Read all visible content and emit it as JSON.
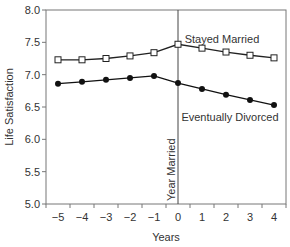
{
  "chart_data": {
    "type": "line",
    "title": "",
    "xlabel": "Years",
    "ylabel": "Life Satisfaction",
    "x": [
      -5,
      -4,
      -3,
      -2,
      -1,
      0,
      1,
      2,
      3,
      4
    ],
    "x_tick_labels": [
      "−5",
      "−4",
      "−3",
      "−2",
      "−1",
      "0",
      "1",
      "2",
      "3",
      "4"
    ],
    "y_ticks": [
      5.0,
      5.5,
      6.0,
      6.5,
      7.0,
      7.5,
      8.0
    ],
    "y_tick_labels": [
      "5.0",
      "5.5",
      "6.0",
      "6.5",
      "7.0",
      "7.5",
      "8.0"
    ],
    "ylim": [
      5.0,
      8.0
    ],
    "grid": false,
    "series": [
      {
        "name": "Stayed Married",
        "marker": "open-square",
        "color": "#222222",
        "values": [
          7.23,
          7.23,
          7.25,
          7.29,
          7.34,
          7.47,
          7.41,
          7.35,
          7.3,
          7.26
        ]
      },
      {
        "name": "Eventually Divorced",
        "marker": "filled-circle",
        "color": "#111111",
        "values": [
          6.86,
          6.89,
          6.92,
          6.95,
          6.98,
          6.87,
          6.78,
          6.69,
          6.61,
          6.53
        ]
      }
    ],
    "annotations": [
      {
        "text": "Year Married",
        "at_x": 0,
        "type": "vertical-line"
      }
    ],
    "legend": "inline-labels"
  }
}
